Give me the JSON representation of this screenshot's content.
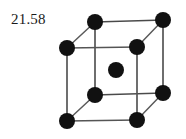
{
  "figure": {
    "label": "21.58",
    "caption_text": "21.58",
    "background_color": "#ffffff",
    "atom_color": "#111111",
    "edge_color": "#4a4a4a",
    "structure_name": "body-centered-cubic-unit-cell",
    "atom_count_total": 9,
    "corner_atom_count": 8,
    "center_atom_count": 1,
    "atom_radius": 8,
    "edge_width": 1.6
  },
  "geometry": {
    "canvas": {
      "width": 186,
      "height": 139
    },
    "front_face": {
      "top_left": {
        "x": 67,
        "y": 48
      },
      "top_right": {
        "x": 137,
        "y": 47
      },
      "bottom_right": {
        "x": 137,
        "y": 120
      },
      "bottom_left": {
        "x": 67,
        "y": 121
      }
    },
    "back_face": {
      "top_left": {
        "x": 95,
        "y": 22
      },
      "top_right": {
        "x": 163,
        "y": 20
      },
      "bottom_right": {
        "x": 163,
        "y": 93
      },
      "bottom_left": {
        "x": 95,
        "y": 95
      }
    },
    "center_atom": {
      "x": 116,
      "y": 70
    }
  },
  "atoms": [
    {
      "id": "front-top-left",
      "x": 67,
      "y": 48,
      "r": 8,
      "role": "corner"
    },
    {
      "id": "front-top-right",
      "x": 137,
      "y": 47,
      "r": 8,
      "role": "corner"
    },
    {
      "id": "front-bottom-right",
      "x": 137,
      "y": 120,
      "r": 8,
      "role": "corner"
    },
    {
      "id": "front-bottom-left",
      "x": 67,
      "y": 121,
      "r": 8,
      "role": "corner"
    },
    {
      "id": "back-top-left",
      "x": 95,
      "y": 22,
      "r": 8,
      "role": "corner"
    },
    {
      "id": "back-top-right",
      "x": 163,
      "y": 20,
      "r": 8,
      "role": "corner"
    },
    {
      "id": "back-bottom-right",
      "x": 163,
      "y": 93,
      "r": 8,
      "role": "corner"
    },
    {
      "id": "back-bottom-left",
      "x": 95,
      "y": 95,
      "r": 8,
      "role": "corner"
    },
    {
      "id": "body-center",
      "x": 116,
      "y": 70,
      "r": 8,
      "role": "center"
    }
  ],
  "edges": [
    {
      "id": "front-top",
      "x1": 67,
      "y1": 48,
      "x2": 137,
      "y2": 47,
      "kind": "front"
    },
    {
      "id": "front-right",
      "x1": 137,
      "y1": 47,
      "x2": 137,
      "y2": 120,
      "kind": "front"
    },
    {
      "id": "front-bottom",
      "x1": 137,
      "y1": 120,
      "x2": 67,
      "y2": 121,
      "kind": "front"
    },
    {
      "id": "front-left",
      "x1": 67,
      "y1": 121,
      "x2": 67,
      "y2": 48,
      "kind": "front"
    },
    {
      "id": "back-top",
      "x1": 95,
      "y1": 22,
      "x2": 163,
      "y2": 20,
      "kind": "back"
    },
    {
      "id": "back-right",
      "x1": 163,
      "y1": 20,
      "x2": 163,
      "y2": 93,
      "kind": "back"
    },
    {
      "id": "back-bottom",
      "x1": 163,
      "y1": 93,
      "x2": 95,
      "y2": 95,
      "kind": "back"
    },
    {
      "id": "back-left",
      "x1": 95,
      "y1": 95,
      "x2": 95,
      "y2": 22,
      "kind": "back"
    },
    {
      "id": "depth-top-left",
      "x1": 67,
      "y1": 48,
      "x2": 95,
      "y2": 22,
      "kind": "depth"
    },
    {
      "id": "depth-top-right",
      "x1": 137,
      "y1": 47,
      "x2": 163,
      "y2": 20,
      "kind": "depth"
    },
    {
      "id": "depth-bottom-right",
      "x1": 137,
      "y1": 120,
      "x2": 163,
      "y2": 93,
      "kind": "depth"
    },
    {
      "id": "depth-bottom-left",
      "x1": 67,
      "y1": 121,
      "x2": 95,
      "y2": 95,
      "kind": "depth"
    }
  ]
}
